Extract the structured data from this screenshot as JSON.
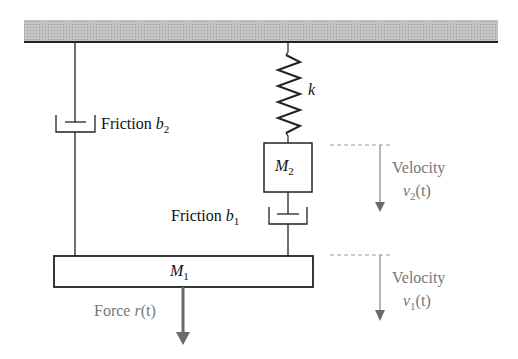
{
  "diagram": {
    "elements": {
      "ceiling": {
        "label": ""
      },
      "spring": {
        "symbol": "k"
      },
      "mass2": {
        "symbol": "M",
        "sub": "2"
      },
      "mass1": {
        "symbol": "M",
        "sub": "1"
      },
      "friction_b2": {
        "text": "Friction ",
        "symbol": "b",
        "sub": "2"
      },
      "friction_b1": {
        "text": "Friction ",
        "symbol": "b",
        "sub": "1"
      },
      "velocity2": {
        "text": "Velocity",
        "symbol": "v",
        "sub": "2",
        "arg": "(t)"
      },
      "velocity1": {
        "text": "Velocity",
        "symbol": "v",
        "sub": "1",
        "arg": "(t)"
      },
      "force": {
        "text": "Force ",
        "symbol": "r",
        "arg": "(t)"
      }
    },
    "colors": {
      "ceiling_fill": "#b8b8b8",
      "line": "#222222",
      "arrow": "#777777",
      "dashed": "#999999"
    }
  }
}
